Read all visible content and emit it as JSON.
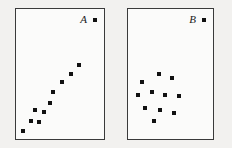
{
  "figure": {
    "background_color": "#f2f1ef",
    "panel_background": "#fbfbfa",
    "border_color": "#3a3a3a",
    "marker_color": "#111111",
    "marker_size_px": 4
  },
  "chart_data": [
    {
      "type": "scatter",
      "title": "A",
      "panel_label": "A",
      "xlabel": "",
      "ylabel": "",
      "grid": false,
      "legend": "none",
      "axis_ticks": false,
      "xlim": [
        0,
        100
      ],
      "ylim": [
        0,
        100
      ],
      "description": "Strong positive linear association; points form a tight upward diagonal band in the lower-left region of the frame.",
      "points": [
        {
          "x": 8,
          "y": 6
        },
        {
          "x": 17,
          "y": 14
        },
        {
          "x": 26,
          "y": 13
        },
        {
          "x": 21,
          "y": 22
        },
        {
          "x": 32,
          "y": 21
        },
        {
          "x": 39,
          "y": 28
        },
        {
          "x": 42,
          "y": 36
        },
        {
          "x": 52,
          "y": 44
        },
        {
          "x": 62,
          "y": 50
        },
        {
          "x": 72,
          "y": 57
        }
      ]
    },
    {
      "type": "scatter",
      "title": "B",
      "panel_label": "B",
      "xlabel": "",
      "ylabel": "",
      "grid": false,
      "legend": "none",
      "axis_ticks": false,
      "xlim": [
        0,
        100
      ],
      "ylim": [
        0,
        100
      ],
      "description": "No association; points form a roughly circular random cluster in the lower-left-to-center region of the frame.",
      "points": [
        {
          "x": 16,
          "y": 44
        },
        {
          "x": 36,
          "y": 50
        },
        {
          "x": 52,
          "y": 47
        },
        {
          "x": 12,
          "y": 34
        },
        {
          "x": 28,
          "y": 36
        },
        {
          "x": 44,
          "y": 34
        },
        {
          "x": 60,
          "y": 33
        },
        {
          "x": 20,
          "y": 24
        },
        {
          "x": 38,
          "y": 22
        },
        {
          "x": 54,
          "y": 20
        },
        {
          "x": 30,
          "y": 14
        }
      ]
    }
  ],
  "panels": {
    "a": {
      "label": "A",
      "marker_name": "legend-square-marker"
    },
    "b": {
      "label": "B",
      "marker_name": "legend-square-marker"
    }
  }
}
